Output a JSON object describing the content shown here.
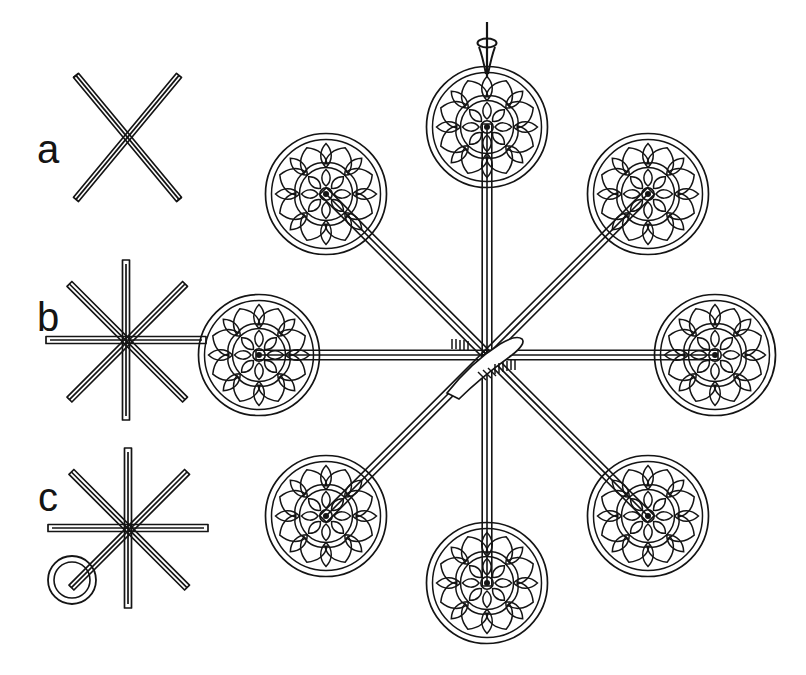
{
  "plate": {
    "title": "Openwork rosette-disc cross-bar mount assembly",
    "background_color": "#ffffff",
    "ink_color": "#141414",
    "width": 806,
    "height": 675
  },
  "figures": [
    {
      "label": "a",
      "label_x": 48,
      "label_y": 152,
      "name": "two-crossed-rods",
      "caption_text": "a",
      "center_x": 126,
      "center_y": 141,
      "rod_count": 2,
      "rod_half_length": 62,
      "rod_width": 7,
      "rod_angles_deg": [
        45,
        135
      ],
      "has_ring": false
    },
    {
      "label": "b",
      "label_x": 48,
      "label_y": 320,
      "name": "four-crossed-rods-star",
      "caption_text": "b",
      "center_x": 126,
      "center_y": 340,
      "rod_count": 4,
      "rod_half_length": 80,
      "rod_width": 7,
      "rod_angles_deg": [
        0,
        45,
        90,
        135
      ],
      "has_ring": false
    },
    {
      "label": "c",
      "label_x": 48,
      "label_y": 500,
      "name": "four-crossed-rods-star-with-suspension-ring",
      "caption_text": "c",
      "center_x": 128,
      "center_y": 528,
      "rod_count": 4,
      "rod_half_length": 80,
      "rod_width": 7,
      "rod_angles_deg": [
        0,
        45,
        90,
        135
      ],
      "has_ring": true,
      "ring_x": 72,
      "ring_y": 580,
      "ring_outer_radius": 24,
      "ring_inner_radius": 18
    }
  ],
  "main_object": {
    "name": "eight-arm-rosette-disc-assembly",
    "center_x": 487,
    "center_y": 355,
    "arm_count": 8,
    "arm_length": 228,
    "arm_width": 9,
    "disc_radius": 61,
    "disc_rim_inset": 7,
    "hub_hatch_marks": 9,
    "suspension_loop": {
      "name": "suspension-loop-knot",
      "x": 487,
      "y": 36,
      "stem_top_y": 22,
      "loop_radius": 7
    },
    "discs": [
      {
        "name": "disc-top",
        "angle_deg": 270,
        "cx": 487,
        "cy": 127
      },
      {
        "name": "disc-upper-right",
        "angle_deg": 315,
        "cx": 648,
        "cy": 194
      },
      {
        "name": "disc-right",
        "angle_deg": 0,
        "cx": 715,
        "cy": 355
      },
      {
        "name": "disc-lower-right",
        "angle_deg": 45,
        "cx": 648,
        "cy": 516
      },
      {
        "name": "disc-bottom",
        "angle_deg": 90,
        "cx": 487,
        "cy": 583
      },
      {
        "name": "disc-lower-left",
        "angle_deg": 135,
        "cx": 326,
        "cy": 516
      },
      {
        "name": "disc-left",
        "angle_deg": 180,
        "cx": 259,
        "cy": 355
      },
      {
        "name": "disc-upper-left",
        "angle_deg": 225,
        "cx": 326,
        "cy": 194
      }
    ],
    "rosette": {
      "name": "openwork-rosette-motif",
      "outer_petal_count": 8,
      "inner_crescent_count": 8,
      "spoke_count": 12,
      "hub_radius": 6,
      "inner_ring_radius": 24,
      "mid_ring_radius": 37
    }
  }
}
